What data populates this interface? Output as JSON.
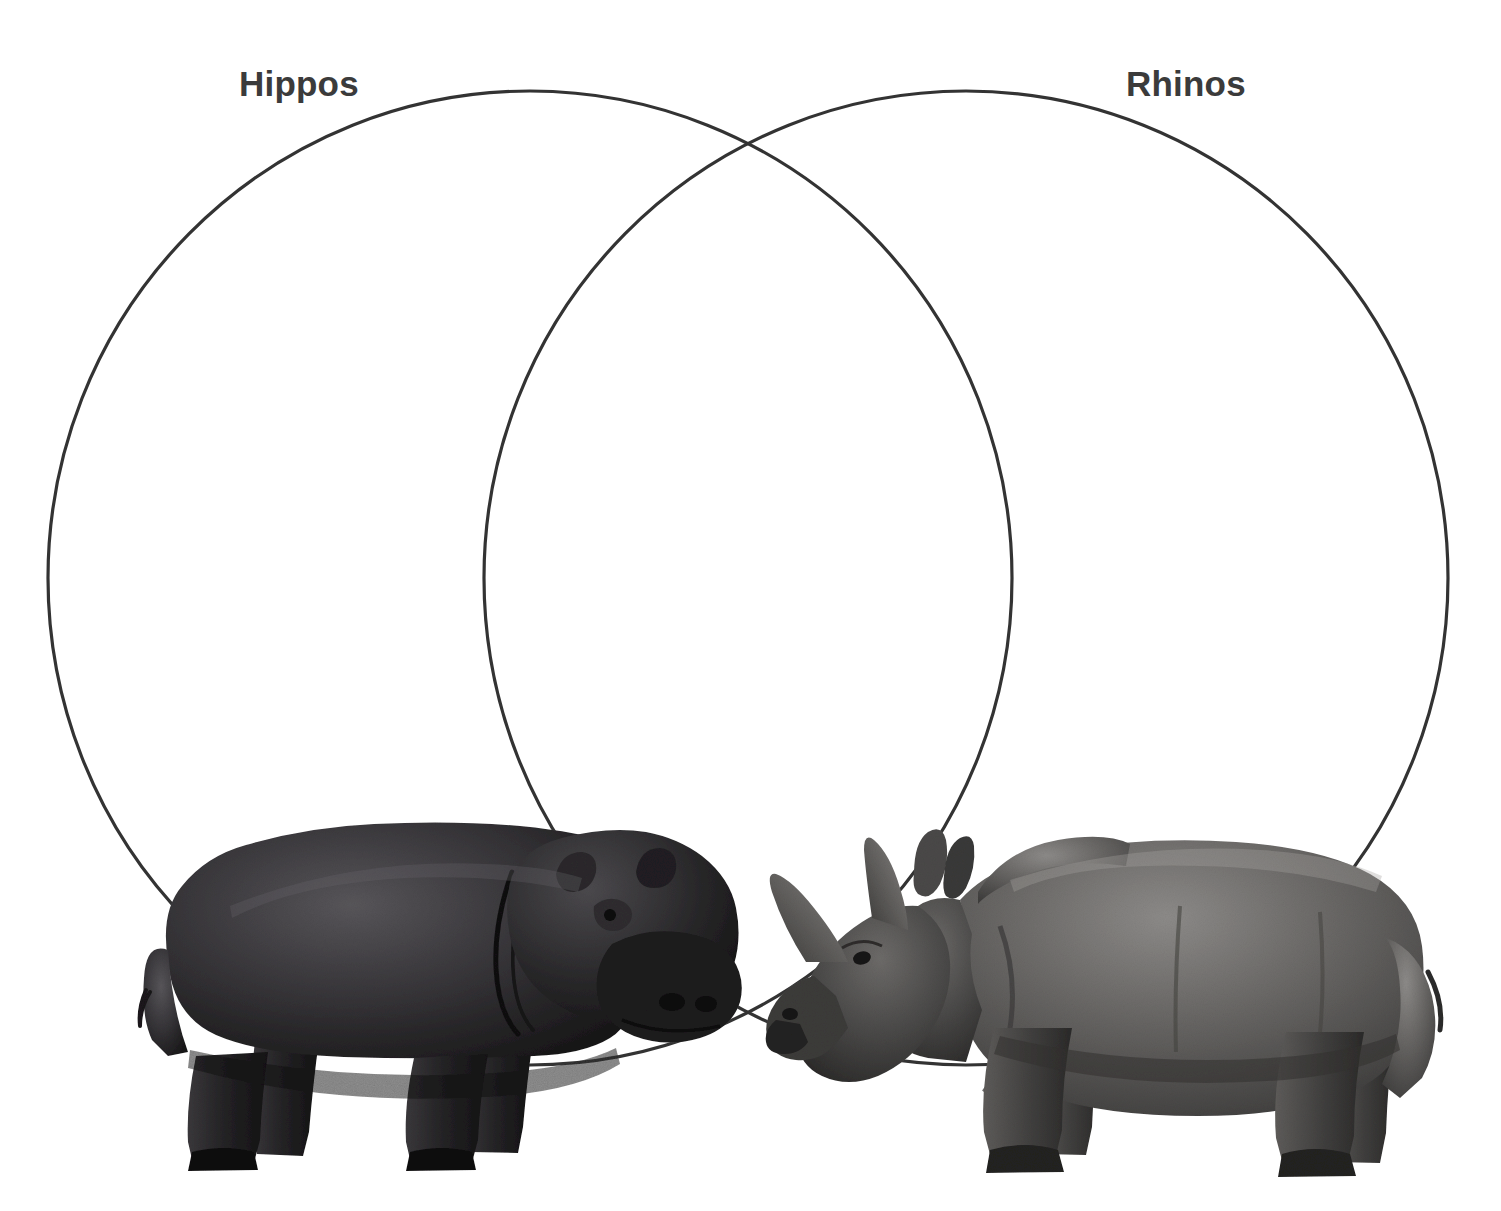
{
  "page": {
    "kind": "venn-diagram-worksheet",
    "width": 1501,
    "height": 1211,
    "background_color": "#ffffff"
  },
  "diagram": {
    "type": "two-circle-venn",
    "stroke_color": "#333333",
    "stroke_width": 3,
    "fill": "none",
    "circles": [
      {
        "id": "left",
        "label": "Hippos",
        "center_x": 530,
        "center_y": 578,
        "radius_x": 482,
        "radius_y": 487
      },
      {
        "id": "right",
        "label": "Rhinos",
        "center_x": 966,
        "center_y": 578,
        "radius_x": 482,
        "radius_y": 487
      }
    ],
    "labels": {
      "left": "Hippos",
      "right": "Rhinos",
      "text_color": "#3b3b3b"
    },
    "regions": {
      "left_only_text": "",
      "overlap_text": "",
      "right_only_text": ""
    }
  },
  "images": [
    {
      "name": "hippo-photo",
      "subject": "Hippopotamus",
      "style": "grayscale photograph, cut out on white",
      "facing": "right",
      "placed_in": "left circle, lower area"
    },
    {
      "name": "rhino-photo",
      "subject": "Rhinoceros",
      "style": "grayscale photograph, cut out on white",
      "facing": "left",
      "placed_in": "right circle, lower area"
    }
  ]
}
